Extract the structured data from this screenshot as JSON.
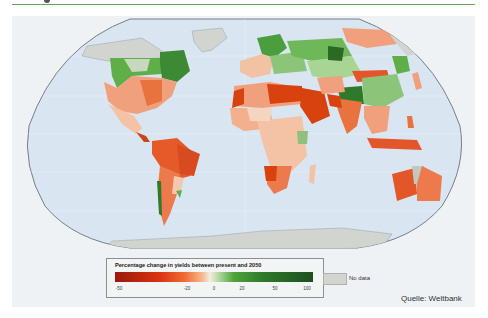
{
  "map": {
    "projection": "Robinson-style world map",
    "ocean_color": "#d8e4f0",
    "nodata_color": "#d2d5cf",
    "regions": [
      {
        "name": "Canada (north)",
        "category": "no data"
      },
      {
        "name": "Canada (south prairies)",
        "category": "increase"
      },
      {
        "name": "Eastern Canada",
        "category": "strong increase"
      },
      {
        "name": "United States",
        "category": "decrease"
      },
      {
        "name": "Mexico / Central America",
        "category": "decrease"
      },
      {
        "name": "South America (Brazil, north)",
        "category": "strong decrease"
      },
      {
        "name": "Chile coast",
        "category": "increase"
      },
      {
        "name": "Argentina",
        "category": "decrease"
      },
      {
        "name": "Greenland",
        "category": "no data"
      },
      {
        "name": "Northern Europe / Scandinavia",
        "category": "increase"
      },
      {
        "name": "Russia (west/central)",
        "category": "increase"
      },
      {
        "name": "Russia (east)",
        "category": "decrease"
      },
      {
        "name": "North Africa / Middle East",
        "category": "strong decrease"
      },
      {
        "name": "Sub-Saharan Africa",
        "category": "decrease"
      },
      {
        "name": "East Africa highlands",
        "category": "increase"
      },
      {
        "name": "South Asia / India",
        "category": "strong decrease"
      },
      {
        "name": "China (west)",
        "category": "strong increase"
      },
      {
        "name": "Mongolia",
        "category": "strong decrease"
      },
      {
        "name": "Southeast Asia",
        "category": "decrease"
      },
      {
        "name": "Australia",
        "category": "strong decrease"
      },
      {
        "name": "New Zealand",
        "category": "increase"
      },
      {
        "name": "Antarctica",
        "category": "no data"
      }
    ]
  },
  "legend": {
    "title": "Percentage change in yields between present and 2050",
    "ticks": [
      "-50",
      "-20",
      "0",
      "20",
      "50",
      "100"
    ],
    "tick_positions": [
      0.02,
      0.36,
      0.5,
      0.64,
      0.8,
      0.97
    ],
    "nodata_label": "No data"
  },
  "source": "Quelle: Weltbank"
}
